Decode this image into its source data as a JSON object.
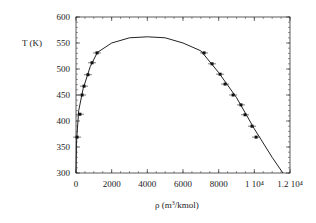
{
  "chart_data": {
    "type": "scatter",
    "title": "",
    "xlabel": "ρ (m³/kmol)",
    "ylabel": "T (K)",
    "xlim": [
      0,
      12000
    ],
    "ylim": [
      300,
      600
    ],
    "xticks": [
      "0",
      "2000",
      "4000",
      "6000",
      "8000",
      "1 10⁴",
      "1.2 10⁴"
    ],
    "yticks": [
      "300",
      "350",
      "400",
      "450",
      "500",
      "550",
      "600"
    ],
    "series": [
      {
        "name": "data",
        "type": "scatter",
        "points": [
          [
            60,
            369
          ],
          [
            220,
            413
          ],
          [
            340,
            450
          ],
          [
            450,
            467
          ],
          [
            670,
            489
          ],
          [
            900,
            512
          ],
          [
            1180,
            531
          ],
          [
            7180,
            531
          ],
          [
            7630,
            510
          ],
          [
            8080,
            490
          ],
          [
            8360,
            471
          ],
          [
            8810,
            450
          ],
          [
            9250,
            431
          ],
          [
            9480,
            412
          ],
          [
            9870,
            390
          ],
          [
            10100,
            369
          ]
        ]
      },
      {
        "name": "fit",
        "type": "line",
        "points": [
          [
            0,
            300
          ],
          [
            30,
            360
          ],
          [
            150,
            420
          ],
          [
            400,
            462
          ],
          [
            800,
            505
          ],
          [
            1200,
            532
          ],
          [
            2000,
            550
          ],
          [
            3000,
            560
          ],
          [
            4000,
            562
          ],
          [
            5000,
            560
          ],
          [
            6000,
            550
          ],
          [
            7000,
            535
          ],
          [
            8000,
            493
          ],
          [
            9000,
            445
          ],
          [
            10000,
            385
          ],
          [
            11000,
            330
          ],
          [
            11600,
            300
          ]
        ]
      }
    ],
    "grid": false
  }
}
